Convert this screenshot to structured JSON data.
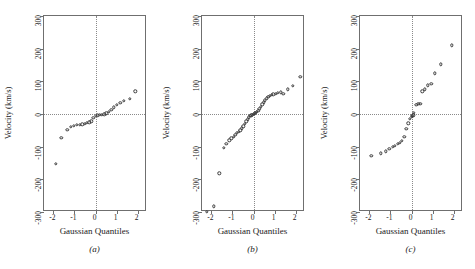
{
  "figure": {
    "background": "#ffffff",
    "marker_color": "#3a3a3a",
    "frame_color": "#6f6f6f",
    "grid_color": "#8a8a8a"
  },
  "axes": {
    "xlabel": "Gaussian Quantiles",
    "ylabel": "Velocity (km/s)",
    "xticks": [
      "-2",
      "-1",
      "0",
      "1",
      "2"
    ],
    "xtick_values": [
      -2,
      -1,
      0,
      1,
      2
    ],
    "yticks": [
      "-300",
      "-200",
      "-100",
      "0",
      "100",
      "200",
      "300"
    ],
    "ytick_values": [
      -300,
      -200,
      -100,
      0,
      100,
      200,
      300
    ],
    "xlim": [
      -2.45,
      2.45
    ],
    "ylim": [
      -300,
      300
    ]
  },
  "panels": [
    {
      "id": "a",
      "caption": "(a)"
    },
    {
      "id": "b",
      "caption": "(b)"
    },
    {
      "id": "c",
      "caption": "(c)"
    }
  ],
  "chart_data": [
    {
      "type": "scatter",
      "title": "(a)",
      "xlabel": "Gaussian Quantiles",
      "ylabel": "Velocity (km/s)",
      "xlim": [
        -2.45,
        2.45
      ],
      "ylim": [
        -300,
        300
      ],
      "grid": true,
      "reference_lines": {
        "vertical_x": 0,
        "horizontal_y": 0
      },
      "x": [
        -1.9,
        -1.62,
        -1.35,
        -1.18,
        -1.02,
        -0.88,
        -0.75,
        -0.63,
        -0.52,
        -0.41,
        -0.3,
        -0.2,
        -0.1,
        0.0,
        0.1,
        0.2,
        0.3,
        0.41,
        0.52,
        0.63,
        0.75,
        0.88,
        1.02,
        1.18,
        1.35,
        1.62,
        1.9
      ],
      "y": [
        -152,
        -72,
        -48,
        -40,
        -36,
        -34,
        -33,
        -32,
        -30,
        -27,
        -25,
        -22,
        -12,
        -6,
        -4,
        -3,
        -2,
        -1,
        2,
        6,
        12,
        20,
        28,
        34,
        40,
        46,
        70
      ]
    },
    {
      "type": "scatter",
      "title": "(b)",
      "xlabel": "Gaussian Quantiles",
      "ylabel": "Velocity (km/s)",
      "xlim": [
        -2.45,
        2.45
      ],
      "ylim": [
        -300,
        300
      ],
      "grid": true,
      "reference_lines": {
        "vertical_x": 0,
        "horizontal_y": 0
      },
      "x": [
        -2.22,
        -1.88,
        -1.62,
        -1.42,
        -1.3,
        -1.15,
        -1.05,
        -0.95,
        -0.86,
        -0.78,
        -0.7,
        -0.62,
        -0.55,
        -0.48,
        -0.41,
        -0.34,
        -0.28,
        -0.22,
        -0.16,
        -0.1,
        -0.05,
        0.0,
        0.05,
        0.1,
        0.16,
        0.22,
        0.28,
        0.34,
        0.41,
        0.48,
        0.55,
        0.62,
        0.7,
        0.78,
        0.86,
        0.95,
        1.05,
        1.15,
        1.3,
        1.42,
        1.62,
        1.88,
        2.22
      ],
      "y": [
        -300,
        -282,
        -182,
        -104,
        -92,
        -80,
        -74,
        -70,
        -64,
        -58,
        -54,
        -50,
        -44,
        -38,
        -30,
        -22,
        -16,
        -10,
        -6,
        -4,
        -2,
        0,
        2,
        4,
        6,
        10,
        16,
        22,
        30,
        36,
        42,
        48,
        52,
        56,
        58,
        60,
        62,
        64,
        66,
        62,
        76,
        86,
        114
      ]
    },
    {
      "type": "scatter",
      "title": "(c)",
      "xlabel": "Gaussian Quantiles",
      "ylabel": "Velocity (km/s)",
      "xlim": [
        -2.45,
        2.45
      ],
      "ylim": [
        -300,
        300
      ],
      "grid": true,
      "reference_lines": {
        "vertical_x": 0,
        "horizontal_y": 0
      },
      "x": [
        -1.92,
        -1.45,
        -1.22,
        -1.05,
        -0.9,
        -0.78,
        -0.66,
        -0.55,
        -0.45,
        -0.35,
        -0.25,
        -0.16,
        -0.08,
        0.0,
        0.04,
        0.08,
        0.12,
        0.22,
        0.32,
        0.42,
        0.52,
        0.62,
        0.78,
        0.95,
        1.12,
        1.4,
        1.92
      ],
      "y": [
        -128,
        -120,
        -114,
        -106,
        -100,
        -98,
        -92,
        -88,
        -82,
        -70,
        -46,
        -28,
        -14,
        -8,
        -6,
        -4,
        4,
        28,
        32,
        32,
        70,
        76,
        88,
        92,
        124,
        152,
        210
      ]
    }
  ]
}
